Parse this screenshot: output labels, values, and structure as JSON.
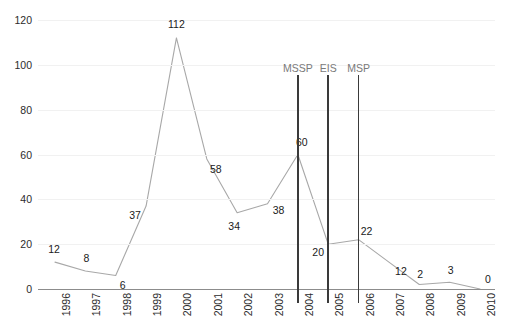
{
  "chart_data": {
    "type": "line",
    "title": "",
    "xlabel": "",
    "ylabel": "",
    "categories": [
      "1996",
      "1997",
      "1998",
      "1999",
      "2000",
      "2001",
      "2002",
      "2003",
      "2004",
      "2005",
      "2006",
      "2007",
      "2008",
      "2009",
      "2010"
    ],
    "values": [
      12,
      8,
      6,
      37,
      112,
      58,
      34,
      38,
      60,
      20,
      22,
      12,
      2,
      3,
      0
    ],
    "series": [
      {
        "name": "count",
        "values": [
          12,
          8,
          6,
          37,
          112,
          58,
          34,
          38,
          60,
          20,
          22,
          12,
          2,
          3,
          0
        ]
      }
    ],
    "ylim": [
      0,
      120
    ],
    "yticks": [
      0,
      20,
      40,
      60,
      80,
      100,
      120
    ],
    "grid": true,
    "legend": "none",
    "data_labels": [
      "12",
      "8",
      "6",
      "37",
      "112",
      "58",
      "34",
      "38",
      "60",
      "20",
      "22",
      "12",
      "2",
      "3",
      "0"
    ],
    "annotations": [
      {
        "label": "MSSP",
        "at_category": "2004"
      },
      {
        "label": "EIS",
        "at_category": "2005"
      },
      {
        "label": "MSP",
        "at_category": "2006"
      }
    ],
    "colors": {
      "line": "#a8a8a8",
      "grid": "#f1f1f1",
      "axis": "#8c8c8c",
      "marker_line": "#3a3a3a",
      "marker_label": "#7a7a7a",
      "label_text": "#1a1a1a",
      "background": "#ffffff"
    }
  },
  "caption": {
    "text": ""
  }
}
